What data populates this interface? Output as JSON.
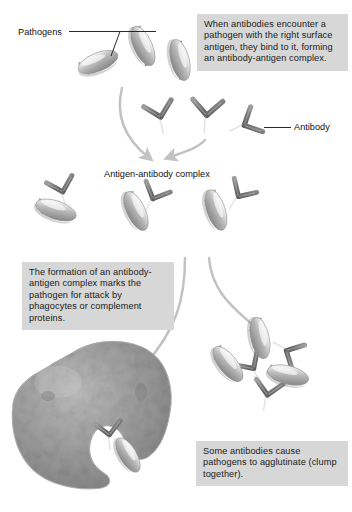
{
  "figure": {
    "background_color": "#ffffff",
    "callout_background": "#d7d7d7",
    "text_color": "#111111",
    "pathogen_color": "#9a9a9a",
    "antibody_color": "#707070",
    "phagocyte_color": "#8d8d8d",
    "arrow_color": "#c2c2c2"
  },
  "callouts": {
    "bind_complex": "When antibodies encounter a pathogen with the right surface antigen, they bind to it, forming an antibody-antigen complex.",
    "phagocyte": "The formation of an antibody-antigen complex marks the pathogen for attack by phagocytes or complement proteins.",
    "agglutinate": "Some antibodies cause pathogens to agglutinate (clump together)."
  },
  "labels": {
    "pathogens": "Pathogens",
    "antibody": "Antibody",
    "antigen_antibody_complex": "Antigen-antibody complex"
  },
  "stages": [
    {
      "name": "free-pathogens-and-antibodies",
      "description": "Three rod-shaped pathogens with surface antigen spikes and three free Y-shaped antibodies",
      "pathogen_count": 3,
      "antibody_count": 3
    },
    {
      "name": "antigen-antibody-complexes",
      "description": "Three pathogens each bound by one antibody",
      "complex_count": 3
    },
    {
      "name": "phagocytosis",
      "description": "A phagocyte engulfing an antigen-antibody complex",
      "phagocyte_count": 1,
      "complex_count": 1
    },
    {
      "name": "agglutination",
      "description": "Three pathogens cross-linked by antibodies into a clump",
      "pathogen_count": 3,
      "antibody_count": 3
    }
  ]
}
